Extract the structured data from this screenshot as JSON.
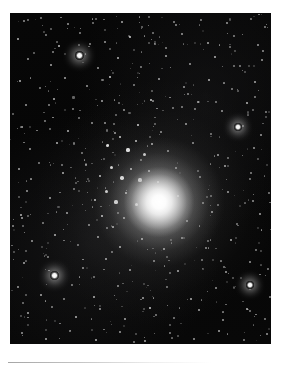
{
  "page": {
    "background_color": "#ffffff",
    "width": 285,
    "height": 366,
    "caption_rule_color": "#b0b0b0"
  },
  "photo": {
    "name": "globular-cluster-photograph",
    "subject": "globular star cluster",
    "description": "Black-and-white astronomical photograph of a globular star cluster: a dense, brilliant unresolved core surrounded by hundreds of resolved individual stars scattered across a dark sky background.",
    "frame": {
      "x": 10,
      "y": 13,
      "width": 261,
      "height": 331
    },
    "sky_color": "#060606",
    "star_color": "#ffffff",
    "core": {
      "label": "cluster-core",
      "center_x": 159,
      "center_y": 202,
      "brightness": "saturated white",
      "core_radius_px": 20,
      "halo_radius_px": 75
    },
    "notable_stars": [
      {
        "label": "bright-star-upper-left",
        "x": 79,
        "y": 55,
        "size": 4.5
      },
      {
        "label": "bright-star-right-mid",
        "x": 238,
        "y": 127,
        "size": 4.0
      },
      {
        "label": "bright-star-lower-left",
        "x": 54,
        "y": 275,
        "size": 4.5
      },
      {
        "label": "bright-star-lower-right",
        "x": 250,
        "y": 285,
        "size": 4.0
      }
    ],
    "star_count_estimate": 540
  },
  "chart_data": {
    "type": "scatter",
    "xlabel": "",
    "ylabel": "",
    "note": "Star positions are given in photograph-frame pixel coordinates relative to the photo frame origin; 'b' is relative brightness 0-1 and 'r' is rendered radius in pixels.",
    "xlim": [
      0,
      261
    ],
    "ylim": [
      0,
      331
    ],
    "grid": false,
    "legend": null,
    "stars": [
      {
        "x": 14,
        "y": 8,
        "r": 0.9,
        "b": 0.55
      },
      {
        "x": 31,
        "y": 5,
        "r": 0.8,
        "b": 0.45
      },
      {
        "x": 58,
        "y": 11,
        "r": 1.0,
        "b": 0.6
      },
      {
        "x": 86,
        "y": 6,
        "r": 0.8,
        "b": 0.4
      },
      {
        "x": 112,
        "y": 9,
        "r": 1.1,
        "b": 0.65
      },
      {
        "x": 139,
        "y": 4,
        "r": 0.8,
        "b": 0.4
      },
      {
        "x": 166,
        "y": 12,
        "r": 1.0,
        "b": 0.55
      },
      {
        "x": 191,
        "y": 7,
        "r": 0.9,
        "b": 0.5
      },
      {
        "x": 217,
        "y": 10,
        "r": 1.0,
        "b": 0.6
      },
      {
        "x": 241,
        "y": 6,
        "r": 0.8,
        "b": 0.45
      },
      {
        "x": 255,
        "y": 14,
        "r": 0.9,
        "b": 0.5
      },
      {
        "x": 8,
        "y": 26,
        "r": 1.1,
        "b": 0.7
      },
      {
        "x": 36,
        "y": 22,
        "r": 0.9,
        "b": 0.5
      },
      {
        "x": 49,
        "y": 33,
        "r": 1.2,
        "b": 0.75
      },
      {
        "x": 70,
        "y": 20,
        "r": 0.9,
        "b": 0.5
      },
      {
        "x": 95,
        "y": 29,
        "r": 1.0,
        "b": 0.6
      },
      {
        "x": 120,
        "y": 24,
        "r": 1.3,
        "b": 0.8
      },
      {
        "x": 145,
        "y": 31,
        "r": 0.9,
        "b": 0.5
      },
      {
        "x": 172,
        "y": 21,
        "r": 1.0,
        "b": 0.6
      },
      {
        "x": 198,
        "y": 30,
        "r": 1.1,
        "b": 0.65
      },
      {
        "x": 224,
        "y": 23,
        "r": 0.9,
        "b": 0.5
      },
      {
        "x": 248,
        "y": 32,
        "r": 1.0,
        "b": 0.6
      },
      {
        "x": 18,
        "y": 46,
        "r": 1.0,
        "b": 0.6
      },
      {
        "x": 41,
        "y": 52,
        "r": 1.1,
        "b": 0.65
      },
      {
        "x": 69,
        "y": 42,
        "r": 4.5,
        "b": 1.0
      },
      {
        "x": 88,
        "y": 55,
        "r": 1.0,
        "b": 0.6
      },
      {
        "x": 108,
        "y": 45,
        "r": 1.2,
        "b": 0.7
      },
      {
        "x": 131,
        "y": 54,
        "r": 0.9,
        "b": 0.5
      },
      {
        "x": 156,
        "y": 43,
        "r": 1.1,
        "b": 0.65
      },
      {
        "x": 180,
        "y": 51,
        "r": 1.0,
        "b": 0.6
      },
      {
        "x": 205,
        "y": 44,
        "r": 1.2,
        "b": 0.7
      },
      {
        "x": 230,
        "y": 53,
        "r": 0.9,
        "b": 0.5
      },
      {
        "x": 252,
        "y": 47,
        "r": 1.0,
        "b": 0.6
      },
      {
        "x": 10,
        "y": 68,
        "r": 1.2,
        "b": 0.7
      },
      {
        "x": 30,
        "y": 75,
        "r": 0.9,
        "b": 0.5
      },
      {
        "x": 55,
        "y": 65,
        "r": 1.1,
        "b": 0.65
      },
      {
        "x": 77,
        "y": 73,
        "r": 1.0,
        "b": 0.6
      },
      {
        "x": 100,
        "y": 64,
        "r": 1.3,
        "b": 0.8
      },
      {
        "x": 124,
        "y": 72,
        "r": 0.9,
        "b": 0.5
      },
      {
        "x": 149,
        "y": 66,
        "r": 1.1,
        "b": 0.65
      },
      {
        "x": 174,
        "y": 74,
        "r": 1.0,
        "b": 0.6
      },
      {
        "x": 199,
        "y": 67,
        "r": 1.2,
        "b": 0.7
      },
      {
        "x": 222,
        "y": 76,
        "r": 0.9,
        "b": 0.5
      },
      {
        "x": 245,
        "y": 69,
        "r": 1.1,
        "b": 0.65
      },
      {
        "x": 16,
        "y": 92,
        "r": 1.0,
        "b": 0.6
      },
      {
        "x": 44,
        "y": 86,
        "r": 1.2,
        "b": 0.7
      },
      {
        "x": 63,
        "y": 96,
        "r": 0.9,
        "b": 0.5
      },
      {
        "x": 92,
        "y": 88,
        "r": 1.1,
        "b": 0.65
      },
      {
        "x": 114,
        "y": 97,
        "r": 1.0,
        "b": 0.6
      },
      {
        "x": 141,
        "y": 87,
        "r": 1.3,
        "b": 0.8
      },
      {
        "x": 163,
        "y": 95,
        "r": 0.9,
        "b": 0.5
      },
      {
        "x": 188,
        "y": 89,
        "r": 1.1,
        "b": 0.65
      },
      {
        "x": 212,
        "y": 98,
        "r": 1.0,
        "b": 0.6
      },
      {
        "x": 237,
        "y": 90,
        "r": 1.2,
        "b": 0.7
      },
      {
        "x": 256,
        "y": 99,
        "r": 0.9,
        "b": 0.5
      },
      {
        "x": 12,
        "y": 114,
        "r": 1.1,
        "b": 0.65
      },
      {
        "x": 35,
        "y": 108,
        "r": 0.9,
        "b": 0.5
      },
      {
        "x": 58,
        "y": 118,
        "r": 1.2,
        "b": 0.7
      },
      {
        "x": 82,
        "y": 110,
        "r": 1.0,
        "b": 0.6
      },
      {
        "x": 105,
        "y": 120,
        "r": 1.1,
        "b": 0.65
      },
      {
        "x": 128,
        "y": 112,
        "r": 1.4,
        "b": 0.85
      },
      {
        "x": 151,
        "y": 119,
        "r": 1.0,
        "b": 0.6
      },
      {
        "x": 176,
        "y": 111,
        "r": 1.1,
        "b": 0.65
      },
      {
        "x": 201,
        "y": 121,
        "r": 0.9,
        "b": 0.5
      },
      {
        "x": 228,
        "y": 114,
        "r": 4.0,
        "b": 1.0
      },
      {
        "x": 251,
        "y": 122,
        "r": 1.0,
        "b": 0.6
      },
      {
        "x": 20,
        "y": 136,
        "r": 1.0,
        "b": 0.6
      },
      {
        "x": 47,
        "y": 130,
        "r": 1.2,
        "b": 0.7
      },
      {
        "x": 72,
        "y": 140,
        "r": 0.9,
        "b": 0.5
      },
      {
        "x": 97,
        "y": 132,
        "r": 1.5,
        "b": 0.9
      },
      {
        "x": 110,
        "y": 124,
        "r": 1.4,
        "b": 0.85
      },
      {
        "x": 118,
        "y": 137,
        "r": 1.6,
        "b": 0.95
      },
      {
        "x": 126,
        "y": 128,
        "r": 1.3,
        "b": 0.8
      },
      {
        "x": 134,
        "y": 141,
        "r": 1.5,
        "b": 0.9
      },
      {
        "x": 142,
        "y": 131,
        "r": 1.2,
        "b": 0.75
      },
      {
        "x": 158,
        "y": 138,
        "r": 1.1,
        "b": 0.65
      },
      {
        "x": 183,
        "y": 130,
        "r": 1.0,
        "b": 0.6
      },
      {
        "x": 208,
        "y": 142,
        "r": 1.1,
        "b": 0.65
      },
      {
        "x": 244,
        "y": 135,
        "r": 1.0,
        "b": 0.6
      },
      {
        "x": 262,
        "y": 128,
        "r": 0.9,
        "b": 0.5
      },
      {
        "x": 9,
        "y": 156,
        "r": 1.1,
        "b": 0.65
      },
      {
        "x": 29,
        "y": 150,
        "r": 0.9,
        "b": 0.5
      },
      {
        "x": 53,
        "y": 160,
        "r": 1.2,
        "b": 0.7
      },
      {
        "x": 76,
        "y": 152,
        "r": 1.0,
        "b": 0.6
      },
      {
        "x": 90,
        "y": 163,
        "r": 1.3,
        "b": 0.8
      },
      {
        "x": 101,
        "y": 154,
        "r": 1.5,
        "b": 0.9
      },
      {
        "x": 112,
        "y": 165,
        "r": 1.7,
        "b": 1.0
      },
      {
        "x": 121,
        "y": 156,
        "r": 1.4,
        "b": 0.85
      },
      {
        "x": 130,
        "y": 167,
        "r": 1.6,
        "b": 0.95
      },
      {
        "x": 139,
        "y": 158,
        "r": 1.3,
        "b": 0.8
      },
      {
        "x": 148,
        "y": 169,
        "r": 1.2,
        "b": 0.75
      },
      {
        "x": 166,
        "y": 155,
        "r": 1.1,
        "b": 0.65
      },
      {
        "x": 190,
        "y": 164,
        "r": 1.0,
        "b": 0.6
      },
      {
        "x": 215,
        "y": 153,
        "r": 1.2,
        "b": 0.7
      },
      {
        "x": 240,
        "y": 166,
        "r": 0.9,
        "b": 0.5
      },
      {
        "x": 17,
        "y": 178,
        "r": 1.0,
        "b": 0.6
      },
      {
        "x": 40,
        "y": 185,
        "r": 1.1,
        "b": 0.65
      },
      {
        "x": 64,
        "y": 176,
        "r": 0.9,
        "b": 0.5
      },
      {
        "x": 85,
        "y": 187,
        "r": 1.3,
        "b": 0.8
      },
      {
        "x": 96,
        "y": 178,
        "r": 1.5,
        "b": 0.9
      },
      {
        "x": 106,
        "y": 189,
        "r": 1.6,
        "b": 0.95
      },
      {
        "x": 116,
        "y": 180,
        "r": 1.4,
        "b": 0.85
      },
      {
        "x": 126,
        "y": 191,
        "r": 1.5,
        "b": 0.9
      },
      {
        "x": 168,
        "y": 183,
        "r": 1.2,
        "b": 0.7
      },
      {
        "x": 193,
        "y": 190,
        "r": 1.0,
        "b": 0.6
      },
      {
        "x": 218,
        "y": 179,
        "r": 1.1,
        "b": 0.65
      },
      {
        "x": 243,
        "y": 188,
        "r": 1.0,
        "b": 0.6
      },
      {
        "x": 259,
        "y": 180,
        "r": 0.9,
        "b": 0.5
      },
      {
        "x": 11,
        "y": 202,
        "r": 1.2,
        "b": 0.7
      },
      {
        "x": 33,
        "y": 210,
        "r": 0.9,
        "b": 0.5
      },
      {
        "x": 57,
        "y": 200,
        "r": 1.1,
        "b": 0.65
      },
      {
        "x": 79,
        "y": 212,
        "r": 1.0,
        "b": 0.6
      },
      {
        "x": 92,
        "y": 203,
        "r": 1.4,
        "b": 0.85
      },
      {
        "x": 103,
        "y": 214,
        "r": 1.3,
        "b": 0.8
      },
      {
        "x": 114,
        "y": 205,
        "r": 1.2,
        "b": 0.75
      },
      {
        "x": 177,
        "y": 208,
        "r": 1.1,
        "b": 0.65
      },
      {
        "x": 202,
        "y": 199,
        "r": 1.2,
        "b": 0.7
      },
      {
        "x": 227,
        "y": 211,
        "r": 0.9,
        "b": 0.5
      },
      {
        "x": 250,
        "y": 201,
        "r": 1.1,
        "b": 0.65
      },
      {
        "x": 22,
        "y": 228,
        "r": 1.0,
        "b": 0.6
      },
      {
        "x": 45,
        "y": 222,
        "r": 1.2,
        "b": 0.7
      },
      {
        "x": 68,
        "y": 232,
        "r": 0.9,
        "b": 0.5
      },
      {
        "x": 88,
        "y": 224,
        "r": 1.1,
        "b": 0.65
      },
      {
        "x": 110,
        "y": 234,
        "r": 1.2,
        "b": 0.75
      },
      {
        "x": 132,
        "y": 226,
        "r": 1.3,
        "b": 0.8
      },
      {
        "x": 154,
        "y": 236,
        "r": 1.2,
        "b": 0.75
      },
      {
        "x": 172,
        "y": 225,
        "r": 1.1,
        "b": 0.65
      },
      {
        "x": 196,
        "y": 235,
        "r": 1.0,
        "b": 0.6
      },
      {
        "x": 221,
        "y": 227,
        "r": 1.2,
        "b": 0.7
      },
      {
        "x": 246,
        "y": 237,
        "r": 0.9,
        "b": 0.5
      },
      {
        "x": 14,
        "y": 250,
        "r": 1.1,
        "b": 0.65
      },
      {
        "x": 38,
        "y": 244,
        "r": 0.9,
        "b": 0.5
      },
      {
        "x": 44,
        "y": 262,
        "r": 4.5,
        "b": 1.0
      },
      {
        "x": 73,
        "y": 255,
        "r": 1.0,
        "b": 0.6
      },
      {
        "x": 96,
        "y": 246,
        "r": 1.2,
        "b": 0.7
      },
      {
        "x": 120,
        "y": 257,
        "r": 1.1,
        "b": 0.65
      },
      {
        "x": 144,
        "y": 248,
        "r": 1.0,
        "b": 0.6
      },
      {
        "x": 168,
        "y": 258,
        "r": 1.2,
        "b": 0.7
      },
      {
        "x": 192,
        "y": 247,
        "r": 0.9,
        "b": 0.5
      },
      {
        "x": 216,
        "y": 259,
        "r": 1.1,
        "b": 0.65
      },
      {
        "x": 240,
        "y": 249,
        "r": 1.0,
        "b": 0.6
      },
      {
        "x": 258,
        "y": 256,
        "r": 0.9,
        "b": 0.5
      },
      {
        "x": 8,
        "y": 274,
        "r": 1.0,
        "b": 0.6
      },
      {
        "x": 31,
        "y": 282,
        "r": 1.1,
        "b": 0.65
      },
      {
        "x": 62,
        "y": 272,
        "r": 0.9,
        "b": 0.5
      },
      {
        "x": 84,
        "y": 284,
        "r": 1.2,
        "b": 0.7
      },
      {
        "x": 108,
        "y": 273,
        "r": 1.0,
        "b": 0.6
      },
      {
        "x": 133,
        "y": 285,
        "r": 1.1,
        "b": 0.65
      },
      {
        "x": 157,
        "y": 274,
        "r": 0.9,
        "b": 0.5
      },
      {
        "x": 181,
        "y": 286,
        "r": 1.2,
        "b": 0.7
      },
      {
        "x": 206,
        "y": 275,
        "r": 1.0,
        "b": 0.6
      },
      {
        "x": 240,
        "y": 272,
        "r": 4.0,
        "b": 1.0
      },
      {
        "x": 260,
        "y": 284,
        "r": 0.9,
        "b": 0.5
      },
      {
        "x": 18,
        "y": 300,
        "r": 1.1,
        "b": 0.65
      },
      {
        "x": 42,
        "y": 294,
        "r": 0.9,
        "b": 0.5
      },
      {
        "x": 66,
        "y": 304,
        "r": 1.2,
        "b": 0.7
      },
      {
        "x": 90,
        "y": 296,
        "r": 1.0,
        "b": 0.6
      },
      {
        "x": 115,
        "y": 306,
        "r": 1.1,
        "b": 0.65
      },
      {
        "x": 140,
        "y": 295,
        "r": 1.3,
        "b": 0.8
      },
      {
        "x": 164,
        "y": 305,
        "r": 0.9,
        "b": 0.5
      },
      {
        "x": 189,
        "y": 297,
        "r": 1.1,
        "b": 0.65
      },
      {
        "x": 213,
        "y": 307,
        "r": 1.0,
        "b": 0.6
      },
      {
        "x": 237,
        "y": 296,
        "r": 1.2,
        "b": 0.7
      },
      {
        "x": 255,
        "y": 306,
        "r": 0.9,
        "b": 0.5
      },
      {
        "x": 12,
        "y": 320,
        "r": 1.0,
        "b": 0.6
      },
      {
        "x": 36,
        "y": 326,
        "r": 1.1,
        "b": 0.65
      },
      {
        "x": 60,
        "y": 318,
        "r": 0.9,
        "b": 0.5
      },
      {
        "x": 86,
        "y": 327,
        "r": 1.2,
        "b": 0.7
      },
      {
        "x": 110,
        "y": 319,
        "r": 1.0,
        "b": 0.6
      },
      {
        "x": 135,
        "y": 328,
        "r": 1.1,
        "b": 0.65
      },
      {
        "x": 160,
        "y": 320,
        "r": 0.9,
        "b": 0.5
      },
      {
        "x": 184,
        "y": 326,
        "r": 1.0,
        "b": 0.6
      },
      {
        "x": 209,
        "y": 318,
        "r": 1.1,
        "b": 0.65
      },
      {
        "x": 234,
        "y": 327,
        "r": 0.9,
        "b": 0.5
      },
      {
        "x": 257,
        "y": 321,
        "r": 1.0,
        "b": 0.6
      }
    ]
  }
}
